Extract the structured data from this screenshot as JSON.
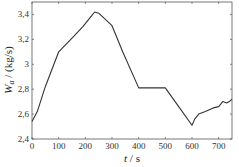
{
  "chart_data": {
    "type": "line",
    "title": "",
    "xlabel": "t / s",
    "ylabel": "W_a / (kg/s)",
    "xlim": [
      0,
      750
    ],
    "ylim": [
      2.4,
      3.5
    ],
    "xticks": [
      0,
      100,
      200,
      300,
      400,
      500,
      600,
      700
    ],
    "yticks": [
      2.4,
      2.6,
      2.8,
      3.0,
      3.2,
      3.4
    ],
    "xtick_labels": [
      "0",
      "100",
      "200",
      "300",
      "400",
      "500",
      "600",
      "700"
    ],
    "ytick_labels": [
      "2,4",
      "2,6",
      "2,8",
      "3",
      "3,2",
      "3,4"
    ],
    "grid": false,
    "series": [
      {
        "name": "W_a",
        "color": "#333333",
        "x": [
          0,
          20,
          50,
          100,
          150,
          190,
          220,
          235,
          250,
          280,
          300,
          340,
          400,
          500,
          550,
          600,
          610,
          625,
          650,
          680,
          700,
          715,
          730,
          740,
          750
        ],
        "y": [
          2.54,
          2.62,
          2.82,
          3.1,
          3.21,
          3.3,
          3.38,
          3.42,
          3.41,
          3.35,
          3.31,
          3.1,
          2.81,
          2.81,
          2.66,
          2.51,
          2.56,
          2.6,
          2.62,
          2.65,
          2.66,
          2.7,
          2.69,
          2.7,
          2.72
        ]
      }
    ]
  },
  "labels": {
    "xlabel_italic": "t",
    "xlabel_unit": " / s",
    "ylabel_main": "W",
    "ylabel_sub": "a",
    "ylabel_unit": " / (kg/s)"
  }
}
